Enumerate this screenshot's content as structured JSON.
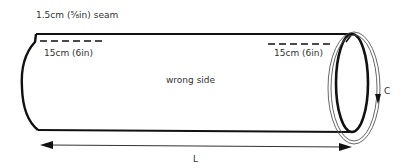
{
  "diagram": {
    "type": "sewing-tube-pattern",
    "labels": {
      "seam_allowance": "1.5cm (⅝in) seam",
      "opening_left": "15cm (6in)",
      "opening_right": "15cm (6in)",
      "side": "wrong side",
      "circumference": "C",
      "length": "L"
    },
    "colors": {
      "stroke": "#111111",
      "text": "#333333",
      "guide": "#555555"
    }
  }
}
